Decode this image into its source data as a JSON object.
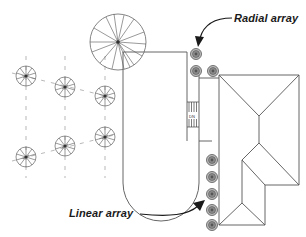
{
  "diagram": {
    "type": "site plan",
    "labels": {
      "radial_array": "Radial array",
      "linear_array": "Linear array",
      "stairs_mark": "DN"
    },
    "elements": {
      "large_tree": {
        "cx": 118,
        "cy": 42,
        "r": 28
      },
      "small_trees_grid": [
        {
          "cx": 26,
          "cy": 76
        },
        {
          "cx": 65,
          "cy": 87
        },
        {
          "cx": 105,
          "cy": 96
        },
        {
          "cx": 26,
          "cy": 157
        },
        {
          "cx": 65,
          "cy": 146
        },
        {
          "cx": 105,
          "cy": 137
        }
      ],
      "radial_array_shrubs": [
        {
          "cx": 196,
          "cy": 54
        },
        {
          "cx": 196,
          "cy": 71
        },
        {
          "cx": 213,
          "cy": 71
        }
      ],
      "linear_array_shrubs": [
        {
          "cx": 212,
          "cy": 160
        },
        {
          "cx": 212,
          "cy": 177
        },
        {
          "cx": 212,
          "cy": 194
        },
        {
          "cx": 212,
          "cy": 211
        },
        {
          "cx": 212,
          "cy": 224
        }
      ]
    },
    "colors": {
      "line": "#555555",
      "shrub_fill": "#9a9a9a",
      "text": "#1a1a1a",
      "arrow": "#1a1a1a"
    }
  }
}
